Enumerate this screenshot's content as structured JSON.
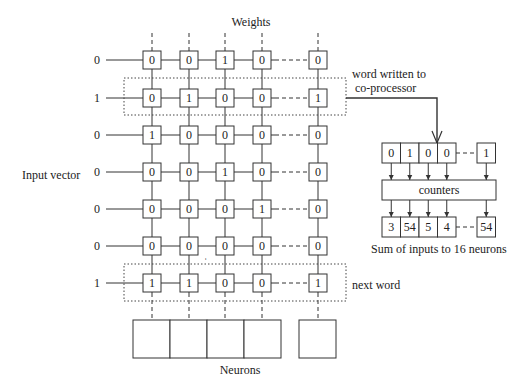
{
  "title": "Weights",
  "input_label": "Input vector",
  "neurons_label": "Neurons",
  "annotations": {
    "word_written_line1": "word written to",
    "word_written_line2": "co-processor",
    "next_word": "next word",
    "sum_caption": "Sum of inputs to 16 neurons",
    "counters": "counters"
  },
  "input_vector": [
    "0",
    "1",
    "0",
    "0",
    "0",
    "0",
    "1"
  ],
  "weights": [
    [
      "0",
      "0",
      "1",
      "0",
      "0"
    ],
    [
      "0",
      "1",
      "0",
      "0",
      "1"
    ],
    [
      "1",
      "0",
      "0",
      "0",
      "0"
    ],
    [
      "0",
      "0",
      "1",
      "0",
      "0"
    ],
    [
      "0",
      "0",
      "0",
      "1",
      "0"
    ],
    [
      "0",
      "0",
      "0",
      "0",
      "0"
    ],
    [
      "1",
      "1",
      "0",
      "0",
      "1"
    ]
  ],
  "register_word": [
    "0",
    "1",
    "0",
    "0",
    "1"
  ],
  "counter_sums": [
    "3",
    "54",
    "5",
    "4",
    "54"
  ],
  "colors": {
    "line": "#333333",
    "text": "#222222",
    "background": "#ffffff"
  }
}
